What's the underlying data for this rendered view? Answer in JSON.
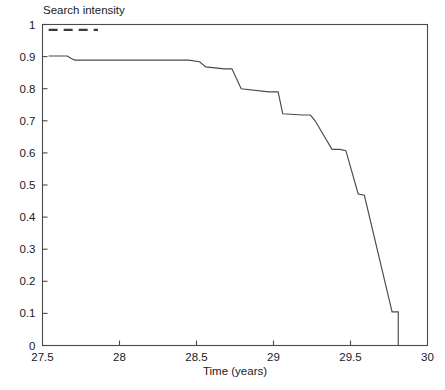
{
  "chart_data": {
    "type": "line",
    "title": "",
    "xlabel": "Time (years)",
    "ylabel": "Search intensity",
    "xlim": [
      27.5,
      30
    ],
    "ylim": [
      0,
      1
    ],
    "grid": false,
    "legend": "none",
    "xticks": [
      27.5,
      28,
      28.5,
      29,
      29.5,
      30
    ],
    "xticklabels": [
      "27.5",
      "28",
      "28.5",
      "29",
      "29.5",
      "30"
    ],
    "yticks": [
      0,
      0.1,
      0.2,
      0.3,
      0.4,
      0.5,
      0.6,
      0.7,
      0.8,
      0.9,
      1
    ],
    "yticklabels": [
      "0",
      "0.1",
      "0.2",
      "0.3",
      "0.4",
      "0.5",
      "0.6",
      "0.7",
      "0.8",
      "0.9",
      "1"
    ],
    "series": [
      {
        "name": "search intensity",
        "style": "solid",
        "x": [
          27.54,
          27.66,
          27.69,
          27.71,
          28.45,
          28.52,
          28.56,
          28.68,
          28.73,
          28.79,
          28.97,
          29.03,
          29.06,
          29.19,
          29.24,
          29.27,
          29.38,
          29.43,
          29.47,
          29.55,
          29.59,
          29.77,
          29.81,
          29.81
        ],
        "y": [
          0.902,
          0.902,
          0.893,
          0.889,
          0.889,
          0.884,
          0.868,
          0.862,
          0.862,
          0.8,
          0.79,
          0.79,
          0.722,
          0.718,
          0.718,
          0.7,
          0.611,
          0.611,
          0.607,
          0.472,
          0.468,
          0.105,
          0.105,
          0.0
        ]
      },
      {
        "name": "dashed-segment",
        "style": "dashed",
        "x": [
          27.54,
          27.86
        ],
        "y": [
          0.983,
          0.983
        ]
      }
    ]
  },
  "axes": {
    "y_title": "Search intensity",
    "x_title": "Time (years)"
  }
}
